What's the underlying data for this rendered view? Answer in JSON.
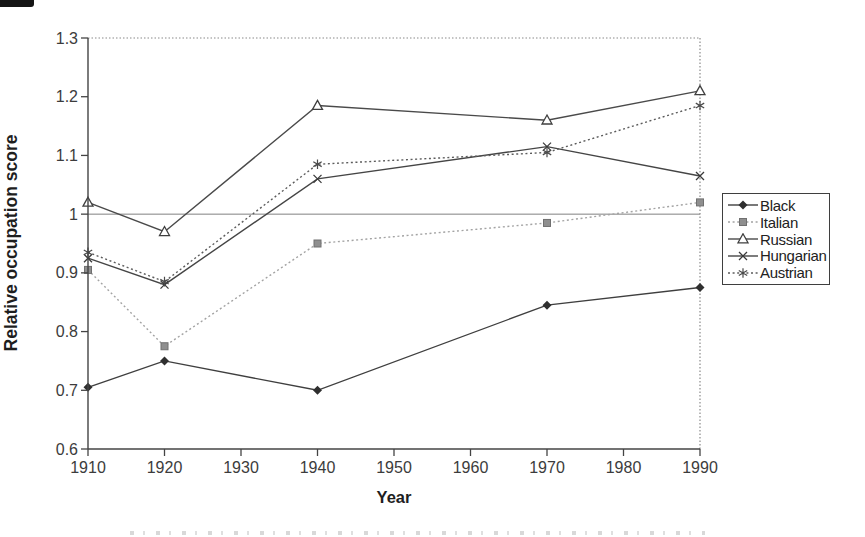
{
  "chart_data": {
    "type": "line",
    "title": "",
    "xlabel": "Year",
    "ylabel": "Relative occupation score",
    "x": [
      1910,
      1920,
      1940,
      1970,
      1990
    ],
    "xlim": [
      1910,
      1990
    ],
    "ylim": [
      0.6,
      1.3
    ],
    "x_ticks": [
      1910,
      1920,
      1930,
      1940,
      1950,
      1960,
      1970,
      1980,
      1990
    ],
    "x_tick_labels": [
      "1910",
      "1920",
      "1930",
      "1940",
      "1950",
      "1960",
      "1970",
      "1980",
      "1990"
    ],
    "y_ticks": [
      0.6,
      0.7,
      0.8,
      0.9,
      1,
      1.1,
      1.2,
      1.3
    ],
    "y_tick_labels": [
      "0.6",
      "0.7",
      "0.8",
      "0.9",
      "1",
      "1.1",
      "1.2",
      "1.3"
    ],
    "reference_line_y": 1,
    "grid": false,
    "legend_position": "right-inside",
    "series": [
      {
        "name": "Black",
        "marker": "diamond",
        "line_style": "solid",
        "color": "#3f3f3f",
        "marker_color": "#2f2f2f",
        "values": [
          0.705,
          0.75,
          0.7,
          0.845,
          0.875
        ]
      },
      {
        "name": "Italian",
        "marker": "square",
        "line_style": "dotted",
        "color": "#a3a3a3",
        "marker_color": "#8f8f8f",
        "values": [
          0.905,
          0.775,
          0.95,
          0.985,
          1.02
        ]
      },
      {
        "name": "Russian",
        "marker": "triangle-open",
        "line_style": "solid",
        "color": "#4a4a4a",
        "marker_color": "#3f3f3f",
        "values": [
          1.02,
          0.97,
          1.185,
          1.16,
          1.21
        ]
      },
      {
        "name": "Hungarian",
        "marker": "x",
        "line_style": "solid",
        "color": "#454545",
        "marker_color": "#3a3a3a",
        "values": [
          0.925,
          0.88,
          1.06,
          1.115,
          1.065
        ]
      },
      {
        "name": "Austrian",
        "marker": "asterisk",
        "line_style": "dotted",
        "color": "#5c5c5c",
        "marker_color": "#4a4a4a",
        "values": [
          0.935,
          0.885,
          1.085,
          1.105,
          1.185
        ]
      }
    ]
  },
  "colors": {
    "axis": "#444444",
    "tick_label": "#3c3c3c",
    "axis_title": "#1e1e1e",
    "plot_border_dotted": "#8a8a8a",
    "reference_line": "#808080",
    "legend_border": "#3f3f3f",
    "legend_text": "#222222"
  }
}
